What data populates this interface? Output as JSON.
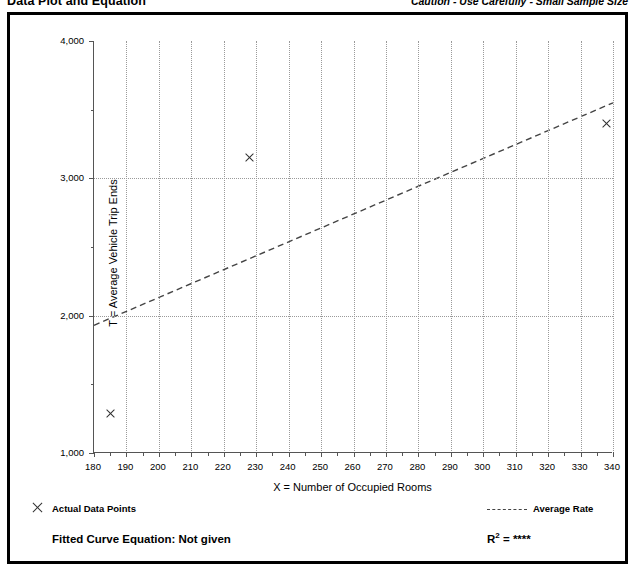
{
  "header": {
    "title": "Data Plot and Equation",
    "caution": "Caution - Use Carefully - Small Sample Size"
  },
  "legend": {
    "data_points_label": "Actual Data Points",
    "average_rate_label": "Average Rate",
    "fitted_curve_label": "Fitted Curve Equation:  Not given",
    "r_squared_prefix": "R",
    "r_squared_exponent": "2",
    "r_squared_value": "= ****"
  },
  "chart_data": {
    "type": "scatter",
    "title": "Data Plot and Equation",
    "xlabel": "X = Number of Occupied Rooms",
    "ylabel": "T = Average Vehicle Trip Ends",
    "xlim": [
      180,
      340
    ],
    "ylim": [
      1000,
      4000
    ],
    "xticks": [
      180,
      190,
      200,
      210,
      220,
      230,
      240,
      250,
      260,
      270,
      280,
      290,
      300,
      310,
      320,
      330,
      340
    ],
    "xtick_labels": [
      "180",
      "190",
      "200",
      "210",
      "220",
      "230",
      "240",
      "250",
      "260",
      "270",
      "280",
      "290",
      "300",
      "310",
      "320",
      "330",
      "340"
    ],
    "xminor_step": 5,
    "yticks": [
      1000,
      2000,
      3000,
      4000
    ],
    "ytick_labels": [
      "1,000",
      "2,000",
      "3,000",
      "4,000"
    ],
    "yminor_ticks": [
      1500,
      2500,
      3500
    ],
    "grid": true,
    "grid_style": "dotted",
    "legend_position": "below-plot",
    "series": [
      {
        "name": "Actual Data Points",
        "type": "scatter",
        "marker": "x",
        "color": "#303030",
        "points": [
          {
            "x": 185,
            "y": 1290
          },
          {
            "x": 228,
            "y": 3150
          },
          {
            "x": 338,
            "y": 3400
          }
        ]
      },
      {
        "name": "Average Rate",
        "type": "line",
        "style": "dashed",
        "color": "#444444",
        "endpoints": [
          {
            "x": 180,
            "y": 1930
          },
          {
            "x": 340,
            "y": 3550
          }
        ]
      }
    ],
    "annotations": {
      "fitted_curve_equation": "Not given",
      "r_squared": "****"
    }
  }
}
